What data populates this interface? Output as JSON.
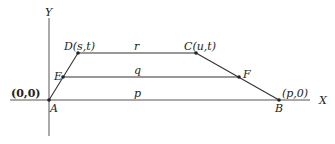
{
  "diagram": {
    "axes": {
      "x_label": "X",
      "y_label": "Y",
      "origin_label": "(0,0)"
    },
    "points": {
      "A": {
        "label": "A"
      },
      "B": {
        "label": "B",
        "coord": "(p,0)"
      },
      "C": {
        "label": "C(u,t)"
      },
      "D": {
        "label": "D(s,t)"
      },
      "E": {
        "label": "E"
      },
      "F": {
        "label": "F"
      }
    },
    "segment_labels": {
      "top": "r",
      "middle": "q",
      "bottom": "p"
    }
  }
}
